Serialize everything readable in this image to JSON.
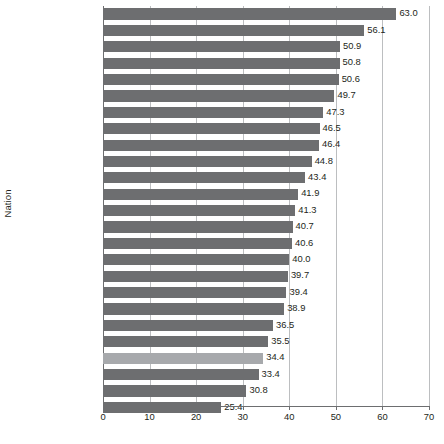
{
  "chart_data": {
    "type": "bar",
    "orientation": "horizontal",
    "title": "",
    "xlabel": "",
    "ylabel": "Nation",
    "xlim": [
      0,
      70
    ],
    "xticks": [
      0,
      10,
      20,
      30,
      40,
      50,
      60,
      70
    ],
    "grid": true,
    "legend": "none",
    "value_label_format": "one-decimal",
    "categories": [
      "Sweden",
      "Denmark",
      "France",
      "Norway",
      "Finland",
      "Belgium",
      "Austria",
      "Netherlands",
      "Italy",
      "Germany",
      "Canada",
      "Poland",
      "Portugal",
      "New Zealand",
      "United Kingdom",
      "Spain",
      "Hungary",
      "Greece",
      "Czech Republic",
      "Iceland",
      "Ireland",
      "United States",
      "Australia",
      "Japan",
      "South Korea"
    ],
    "values": [
      63.0,
      56.1,
      50.9,
      50.8,
      50.6,
      49.7,
      47.3,
      46.5,
      46.4,
      44.8,
      43.4,
      41.9,
      41.3,
      40.7,
      40.6,
      40.0,
      39.7,
      39.4,
      38.9,
      36.5,
      35.5,
      34.4,
      33.4,
      30.8,
      25.4
    ],
    "value_labels": [
      "63.0",
      "56.1",
      "50.9",
      "50.8",
      "50.6",
      "49.7",
      "47.3",
      "46.5",
      "46.4",
      "44.8",
      "43.4",
      "41.9",
      "41.3",
      "40.7",
      "40.6",
      "40.0",
      "39.7",
      "39.4",
      "38.9",
      "36.5",
      "35.5",
      "34.4",
      "33.4",
      "30.8",
      "25.4"
    ],
    "highlighted_category": "United States",
    "tick_labels": [
      "0",
      "10",
      "20",
      "30",
      "40",
      "50",
      "60",
      "70"
    ],
    "colors": {
      "bar": "#6d6e70",
      "bar_highlight": "#a7a9ac",
      "gridline": "#bcbec0",
      "axis": "#6d6e70",
      "text": "#231f20",
      "background": "#ffffff"
    }
  }
}
